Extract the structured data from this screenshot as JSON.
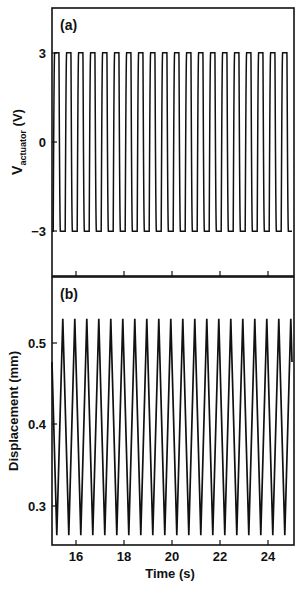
{
  "chart_data": [
    {
      "type": "line",
      "panel_label": "(a)",
      "title": "",
      "xlabel": "Time (s)",
      "ylabel": "V",
      "ylabel_subscript": "actuator",
      "ylabel_unit": " (V)",
      "xlim": [
        15,
        25
      ],
      "ylim": [
        -4.5,
        4.5
      ],
      "yticks": [
        -3,
        0,
        3
      ],
      "ytick_labels": [
        "−3",
        "0",
        "3"
      ],
      "xticks": [
        16,
        18,
        20,
        22,
        24
      ],
      "grid": false,
      "series": [
        {
          "name": "V_actuator",
          "waveform": "square-like (rounded), 2 Hz",
          "frequency_hz": 2.0,
          "period_s": 0.5,
          "amplitude_v": 3.0,
          "min_v": -3.0,
          "max_v": 3.0,
          "phase_start_s": 15.05
        }
      ]
    },
    {
      "type": "line",
      "panel_label": "(b)",
      "title": "",
      "xlabel": "Time (s)",
      "ylabel": "Displacement (mm)",
      "xlim": [
        15,
        25
      ],
      "ylim": [
        0.253,
        0.581
      ],
      "yticks": [
        0.3,
        0.4,
        0.5
      ],
      "ytick_labels": [
        "0.3",
        "0.4",
        "0.5"
      ],
      "xticks": [
        16,
        18,
        20,
        22,
        24
      ],
      "xtick_labels": [
        "16",
        "18",
        "20",
        "22",
        "24"
      ],
      "grid": false,
      "series": [
        {
          "name": "Displacement",
          "waveform": "triangular, 2 Hz",
          "frequency_hz": 2.0,
          "period_s": 0.5,
          "peak_mm": 0.53,
          "trough_mm": 0.265,
          "phase_start_s": 15.05
        }
      ]
    }
  ],
  "panels": {
    "a": {
      "label": "(a)",
      "ylabel_main": "V",
      "ylabel_sub": "actuator",
      "ylabel_unit": " (V)",
      "ytick_labels": [
        "3",
        "0",
        "−3"
      ]
    },
    "b": {
      "label": "(b)",
      "ylabel": "Displacement (mm)",
      "ytick_labels": [
        "0.5",
        "0.4",
        "0.3"
      ]
    }
  },
  "xaxis": {
    "label": "Time (s)",
    "tick_labels": [
      "16",
      "18",
      "20",
      "22",
      "24"
    ]
  },
  "colors": {
    "line": "#111111",
    "background": "#ffffff"
  }
}
